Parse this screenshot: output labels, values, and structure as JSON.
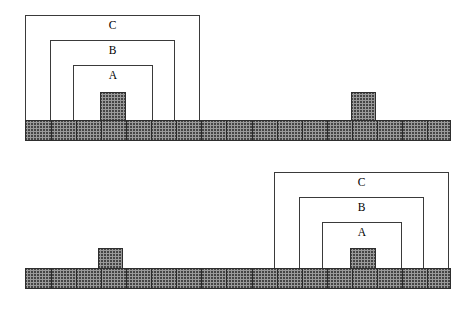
{
  "figure": {
    "width": 472,
    "height": 313,
    "background_color": "#ffffff",
    "line_color": "#3a3a3a",
    "hatch_fill_color": "#9a9a9a",
    "hatch_line_color": "#2e2e2e"
  },
  "panels": [
    {
      "id": "top-panel",
      "name": "upper-configuration",
      "ground": {
        "x": 25,
        "y": 120,
        "width": 426,
        "height": 21,
        "segment_count": 17
      },
      "zones": [
        {
          "id": "C",
          "label": "C",
          "x": 25,
          "y": 15,
          "width": 175,
          "height": 106,
          "label_x": 25,
          "label_y": 19,
          "label_width": 175
        },
        {
          "id": "B",
          "label": "B",
          "x": 50,
          "y": 40,
          "width": 125,
          "height": 81,
          "label_x": 50,
          "label_y": 44,
          "label_width": 125
        },
        {
          "id": "A",
          "label": "A",
          "x": 73,
          "y": 65,
          "width": 80,
          "height": 56,
          "label_x": 73,
          "label_y": 69,
          "label_width": 80
        }
      ],
      "blocks": [
        {
          "id": "center-block",
          "x": 100,
          "y": 92,
          "width": 26,
          "height": 29
        },
        {
          "id": "right-block",
          "x": 351,
          "y": 92,
          "width": 25,
          "height": 29
        }
      ]
    },
    {
      "id": "bottom-panel",
      "name": "lower-configuration",
      "ground": {
        "x": 25,
        "y": 268,
        "width": 426,
        "height": 21,
        "segment_count": 17
      },
      "zones": [
        {
          "id": "C",
          "label": "C",
          "x": 274,
          "y": 172,
          "width": 175,
          "height": 97,
          "label_x": 274,
          "label_y": 176,
          "label_width": 175
        },
        {
          "id": "B",
          "label": "B",
          "x": 299,
          "y": 197,
          "width": 125,
          "height": 72,
          "label_x": 299,
          "label_y": 201,
          "label_width": 125
        },
        {
          "id": "A",
          "label": "A",
          "x": 322,
          "y": 222,
          "width": 80,
          "height": 47,
          "label_x": 322,
          "label_y": 226,
          "label_width": 80
        }
      ],
      "blocks": [
        {
          "id": "left-block",
          "x": 98,
          "y": 248,
          "width": 25,
          "height": 21
        },
        {
          "id": "center-block",
          "x": 350,
          "y": 248,
          "width": 26,
          "height": 21
        }
      ]
    }
  ]
}
